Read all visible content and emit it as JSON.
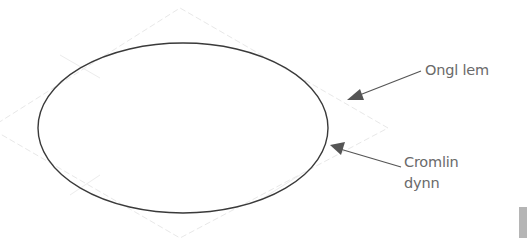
{
  "diagram": {
    "shape": {
      "type": "ellipse",
      "cx": 183,
      "cy": 128,
      "rx": 145,
      "ry": 85,
      "stroke": "#3a3a3a"
    },
    "guide_diamond": {
      "points": "180,8 388,128 180,238 -10,128",
      "stroke": "#e6e6e6"
    },
    "annotations": [
      {
        "id": "outer",
        "text_lines": [
          "Ongl lem"
        ],
        "arrow_from": [
          420,
          70
        ],
        "arrow_to": [
          347,
          100
        ]
      },
      {
        "id": "inner",
        "text_lines": [
          "Cromlin",
          "dynn"
        ],
        "arrow_from": [
          401,
          167
        ],
        "arrow_to": [
          330,
          145
        ]
      }
    ],
    "colors": {
      "text": "#6a6a6a",
      "arrow": "#555555",
      "corner_box": "#b5b5b5"
    }
  },
  "labels": {
    "outer": "Ongl lem",
    "inner_line1": "Cromlin",
    "inner_line2": "dynn"
  }
}
